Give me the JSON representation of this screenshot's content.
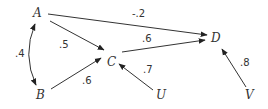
{
  "diagram": {
    "type": "path-diagram",
    "nodes": [
      {
        "id": "A",
        "label": "A",
        "x": 37,
        "y": 17
      },
      {
        "id": "B",
        "label": "B",
        "x": 40,
        "y": 99
      },
      {
        "id": "C",
        "label": "C",
        "x": 112,
        "y": 66
      },
      {
        "id": "D",
        "label": "D",
        "x": 215,
        "y": 42
      },
      {
        "id": "U",
        "label": "U",
        "x": 160,
        "y": 99
      },
      {
        "id": "V",
        "label": "V",
        "x": 250,
        "y": 99
      }
    ],
    "edges": [
      {
        "from": "A",
        "to": "D",
        "label": "-.2",
        "type": "directed"
      },
      {
        "from": "A",
        "to": "C",
        "label": ".5",
        "type": "directed"
      },
      {
        "from": "B",
        "to": "C",
        "label": ".6",
        "type": "directed"
      },
      {
        "from": "C",
        "to": "D",
        "label": ".6",
        "type": "directed"
      },
      {
        "from": "U",
        "to": "C",
        "label": ".7",
        "type": "directed"
      },
      {
        "from": "V",
        "to": "D",
        "label": ".8",
        "type": "directed"
      },
      {
        "from": "A",
        "to": "B",
        "label": ".4",
        "type": "bidirected-curved"
      }
    ]
  }
}
